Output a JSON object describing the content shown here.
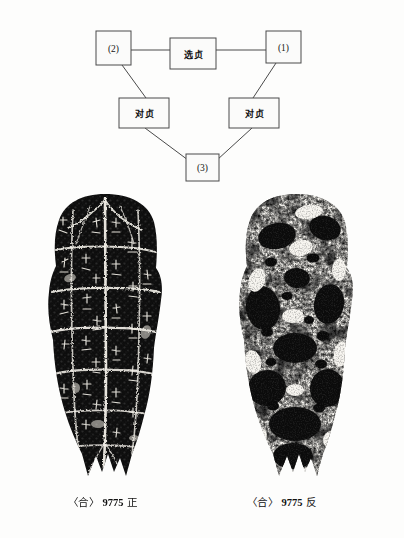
{
  "page": {
    "kind": "scanned-book-page",
    "background_color": "#fdfdfc",
    "ink_color": "#111111"
  },
  "diagram": {
    "name": "divination-pairing-diagram",
    "line_color": "#4a4a4a",
    "boxes": [
      {
        "id": "box-2",
        "label": "(2)",
        "x": 96,
        "y": 31,
        "w": 35,
        "h": 34,
        "script": "latin"
      },
      {
        "id": "box-xuanzhen",
        "label": "选贞",
        "x": 170,
        "y": 38,
        "w": 46,
        "h": 31,
        "script": "cjk"
      },
      {
        "id": "box-1",
        "label": "(1)",
        "x": 266,
        "y": 31,
        "w": 35,
        "h": 32,
        "script": "latin"
      },
      {
        "id": "box-duizhen-left",
        "label": "对贞",
        "x": 119,
        "y": 98,
        "w": 50,
        "h": 30,
        "script": "cjk"
      },
      {
        "id": "box-duizhen-right",
        "label": "对贞",
        "x": 229,
        "y": 98,
        "w": 50,
        "h": 30,
        "script": "cjk"
      },
      {
        "id": "box-3",
        "label": "(3)",
        "x": 186,
        "y": 154,
        "w": 33,
        "h": 27,
        "script": "latin"
      }
    ],
    "connections": [
      {
        "from": "box-2",
        "to": "box-xuanzhen",
        "style": "horizontal"
      },
      {
        "from": "box-xuanzhen",
        "to": "box-1",
        "style": "horizontal"
      },
      {
        "from": "box-2",
        "to": "box-duizhen-left",
        "style": "diagonal"
      },
      {
        "from": "box-1",
        "to": "box-duizhen-right",
        "style": "diagonal"
      },
      {
        "from": "box-duizhen-left",
        "to": "box-3",
        "style": "diagonal"
      },
      {
        "from": "box-duizhen-right",
        "to": "box-3",
        "style": "diagonal"
      }
    ]
  },
  "plates": [
    {
      "id": "plate-obverse",
      "name": "oracle-bone-rubbing-obverse",
      "description": "turtle plastron rubbing, obverse with engraved divination inscriptions and cracks",
      "side": "obverse"
    },
    {
      "id": "plate-reverse",
      "name": "oracle-bone-rubbing-reverse",
      "description": "turtle plastron rubbing, reverse showing hollows and burn pits",
      "side": "reverse"
    }
  ],
  "captions": {
    "left": {
      "open_bracket": "〈",
      "collection": "合",
      "close_bracket": "〉",
      "number": "9775",
      "side": "正",
      "full": "〈合〉9775 正"
    },
    "right": {
      "open_bracket": "〈",
      "collection": "合",
      "close_bracket": "〉",
      "number": "9775",
      "side": "反",
      "full": "〈合〉9775 反"
    }
  }
}
